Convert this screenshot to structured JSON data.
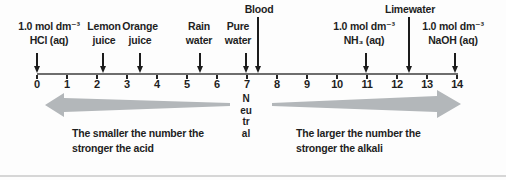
{
  "scale": {
    "min": 0,
    "max": 14,
    "ticks": [
      "0",
      "1",
      "2",
      "3",
      "4",
      "5",
      "6",
      "7",
      "8",
      "9",
      "10",
      "11",
      "12",
      "13",
      "14"
    ]
  },
  "markers": [
    {
      "id": "hcl",
      "lines": [
        "1.0 mol dm⁻³",
        "HCl (aq)"
      ],
      "ph": 0
    },
    {
      "id": "lemon-juice",
      "lines": [
        "Lemon",
        "juice"
      ],
      "ph": 2.2
    },
    {
      "id": "orange-juice",
      "lines": [
        "Orange",
        "juice"
      ],
      "ph": 3.4
    },
    {
      "id": "rain-water",
      "lines": [
        "Rain",
        "water"
      ],
      "ph": 5.4
    },
    {
      "id": "pure-water",
      "lines": [
        "Pure",
        "water"
      ],
      "ph": 7
    },
    {
      "id": "blood",
      "lines": [
        "Blood"
      ],
      "ph": 7.4
    },
    {
      "id": "ammonia",
      "lines": [
        "1.0 mol dm⁻³",
        "NH₃ (aq)"
      ],
      "ph": 11
    },
    {
      "id": "limewater",
      "lines": [
        "Limewater"
      ],
      "ph": 12.4
    },
    {
      "id": "naoh",
      "lines": [
        "1.0 mol dm⁻³",
        "NaOH (aq)"
      ],
      "ph": 14
    }
  ],
  "neutral_label": "Neutral",
  "annotations": {
    "acid": {
      "line1": "The smaller the number the",
      "line2": "stronger the acid"
    },
    "alkali": {
      "line1": "The larger the number the",
      "line2": "stronger the alkali"
    }
  },
  "colors": {
    "ink": "#1f1f1f",
    "axis": "#6e6e6e",
    "arrow_gray": "#b3b7ba"
  }
}
